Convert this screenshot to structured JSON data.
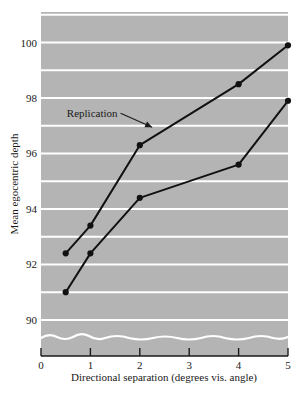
{
  "chart_data": {
    "type": "line",
    "title": "",
    "subtitle": "",
    "xlabel": "Directional separation (degrees vis. angle)",
    "ylabel": "Mean egocentric depth",
    "xlim": [
      0,
      5
    ],
    "ylim": [
      88.7,
      101.1
    ],
    "xticks": [
      0,
      1,
      2,
      3,
      4,
      5
    ],
    "xtick_labels": [
      "0",
      "1",
      "2",
      "3",
      "4",
      "5"
    ],
    "yticks": [
      90,
      92,
      94,
      96,
      98,
      100
    ],
    "ytick_labels": [
      "90",
      "92",
      "94",
      "96",
      "98",
      "100"
    ],
    "gridlines_y": [
      90,
      91,
      92,
      93,
      94,
      95,
      96,
      97,
      98,
      99,
      100,
      101
    ],
    "grid": true,
    "grid_color": "#ffffff",
    "plot_background": "#b4b4b4",
    "axis_color": "#1a1a1a",
    "series_color": "#111111",
    "axis_break": true,
    "legend_position": "none",
    "x": [
      0.5,
      1,
      2,
      4,
      5
    ],
    "series": [
      {
        "name": "Replication",
        "values": [
          92.4,
          93.4,
          96.3,
          98.5,
          99.9
        ],
        "marker": "filled-circle"
      },
      {
        "name": "Original",
        "values": [
          91.0,
          92.4,
          94.4,
          95.6,
          97.9
        ],
        "marker": "filled-circle"
      }
    ],
    "annotations": [
      {
        "text": "Replication",
        "x": 1.55,
        "y": 97.45,
        "arrow_to_x": 2.25,
        "arrow_to_y": 96.95
      }
    ]
  }
}
